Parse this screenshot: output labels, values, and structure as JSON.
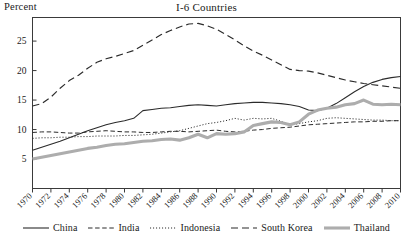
{
  "axis_unit_label": "Percent",
  "chart_data": {
    "type": "line",
    "title": "I-6 Countries",
    "xlabel": "",
    "ylabel": "Percent",
    "xlim": [
      1970,
      2010
    ],
    "ylim": [
      0,
      29
    ],
    "grid": false,
    "legend_position": "bottom",
    "y_ticks": [
      5,
      10,
      15,
      20,
      25
    ],
    "x_ticks": [
      1970,
      1972,
      1974,
      1976,
      1978,
      1980,
      1982,
      1984,
      1986,
      1988,
      1990,
      1992,
      1994,
      1996,
      1998,
      2000,
      2002,
      2004,
      2006,
      2008,
      2010
    ],
    "x": [
      1970,
      1971,
      1972,
      1973,
      1974,
      1975,
      1976,
      1977,
      1978,
      1979,
      1980,
      1981,
      1982,
      1983,
      1984,
      1985,
      1986,
      1987,
      1988,
      1989,
      1990,
      1991,
      1992,
      1993,
      1994,
      1995,
      1996,
      1997,
      1998,
      1999,
      2000,
      2001,
      2002,
      2003,
      2004,
      2005,
      2006,
      2007,
      2008,
      2009,
      2010
    ],
    "series": [
      {
        "name": "China",
        "style": "solid",
        "color": "#2b2b2b",
        "width": 1.1,
        "values": [
          6.5,
          7.0,
          7.5,
          8.0,
          8.6,
          9.2,
          9.8,
          10.3,
          10.8,
          11.2,
          11.5,
          11.9,
          13.2,
          13.4,
          13.6,
          13.7,
          13.9,
          14.1,
          14.2,
          14.1,
          14.0,
          14.2,
          14.4,
          14.5,
          14.6,
          14.6,
          14.5,
          14.4,
          14.2,
          13.9,
          13.3,
          13.2,
          13.6,
          14.4,
          15.4,
          16.4,
          17.3,
          18.0,
          18.5,
          18.8,
          19.0
        ]
      },
      {
        "name": "India",
        "style": "dashed",
        "color": "#2b2b2b",
        "width": 1.0,
        "values": [
          9.5,
          9.6,
          9.6,
          9.5,
          9.4,
          9.4,
          9.6,
          9.7,
          9.8,
          9.7,
          9.6,
          9.6,
          9.5,
          9.5,
          9.6,
          9.7,
          9.7,
          9.6,
          9.7,
          9.8,
          9.9,
          9.7,
          9.6,
          9.7,
          9.9,
          10.0,
          10.2,
          10.3,
          10.4,
          10.6,
          10.8,
          10.9,
          11.0,
          11.1,
          11.2,
          11.3,
          11.3,
          11.4,
          11.4,
          11.5,
          11.5
        ]
      },
      {
        "name": "Indonesia",
        "style": "dotted",
        "color": "#2b2b2b",
        "width": 1.0,
        "values": [
          8.5,
          8.6,
          8.6,
          8.7,
          8.7,
          8.8,
          8.8,
          8.9,
          8.9,
          8.9,
          9.0,
          9.0,
          9.1,
          9.2,
          9.4,
          9.6,
          9.8,
          10.2,
          10.6,
          11.0,
          11.2,
          11.5,
          11.9,
          11.6,
          11.9,
          11.8,
          11.9,
          11.4,
          10.8,
          11.0,
          11.3,
          11.5,
          11.9,
          12.0,
          11.9,
          11.8,
          11.7,
          11.6,
          11.6,
          11.5,
          11.5
        ]
      },
      {
        "name": "South Korea",
        "style": "longdash",
        "color": "#2b2b2b",
        "width": 1.15,
        "values": [
          14.0,
          14.4,
          15.5,
          17.0,
          18.3,
          19.2,
          20.4,
          21.4,
          22.0,
          22.4,
          22.9,
          23.4,
          24.3,
          25.2,
          26.1,
          26.8,
          27.4,
          27.9,
          28.0,
          27.6,
          27.0,
          26.1,
          25.2,
          24.2,
          23.3,
          22.6,
          21.8,
          21.0,
          20.2,
          20.0,
          19.9,
          19.6,
          19.2,
          18.8,
          18.4,
          18.1,
          17.8,
          17.6,
          17.4,
          17.2,
          17.0
        ]
      },
      {
        "name": "Thailand",
        "style": "thick-gray",
        "color": "#adadad",
        "width": 3.1,
        "values": [
          5.0,
          5.3,
          5.6,
          5.9,
          6.2,
          6.5,
          6.8,
          7.0,
          7.3,
          7.5,
          7.6,
          7.8,
          8.0,
          8.1,
          8.3,
          8.4,
          8.2,
          8.6,
          9.2,
          8.6,
          9.3,
          9.2,
          9.3,
          9.6,
          10.7,
          11.0,
          11.3,
          11.2,
          10.8,
          11.3,
          12.6,
          13.3,
          13.6,
          13.8,
          14.2,
          14.4,
          15.0,
          14.3,
          14.2,
          14.3,
          14.2
        ]
      }
    ]
  },
  "legend": [
    {
      "label": "China",
      "style": "solid"
    },
    {
      "label": "India",
      "style": "dashed"
    },
    {
      "label": "Indonesia",
      "style": "dotted"
    },
    {
      "label": "South Korea",
      "style": "longdash"
    },
    {
      "label": "Thailand",
      "style": "thick-gray"
    }
  ]
}
